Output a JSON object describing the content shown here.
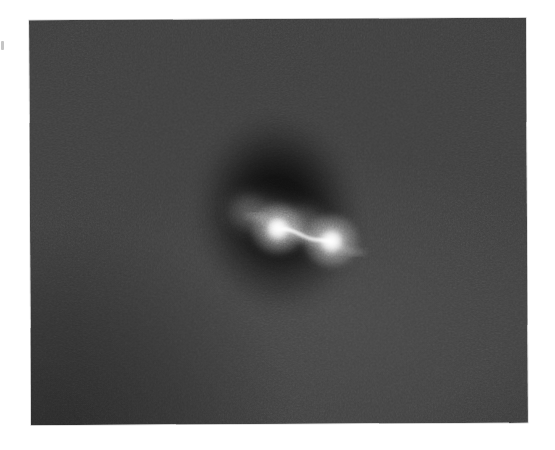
{
  "figure": {
    "kind": "grayscale-astronomical-plate",
    "caption": "",
    "panel": {
      "left": 30,
      "top": 19,
      "width": 497,
      "height": 405,
      "rotation_deg": -0.28,
      "background_color": "#3b3b3b",
      "page_color": "#ffffff"
    },
    "colors": {
      "page": "#ffffff",
      "plate_background": "#3b3b3b",
      "halo_dark": "#141414",
      "core_bright": "#ffffff",
      "bridge": "#e8e8e8"
    },
    "features": [
      {
        "name": "dark-halo",
        "description": "vertically elongated dark elliptical envelope surrounding the pair",
        "cx": 248,
        "cy": 194,
        "rx": 86,
        "ry": 103,
        "rotation_deg": -8
      },
      {
        "name": "core-left",
        "description": "bright compact core, upper left of pair",
        "cx": 248,
        "cy": 210,
        "radius": 11,
        "peak_brightness": 1.0
      },
      {
        "name": "core-right",
        "description": "bright compact core, lower right of pair",
        "cx": 301,
        "cy": 222,
        "radius": 11.5,
        "peak_brightness": 1.0
      },
      {
        "name": "bridge",
        "description": "thin S-curved tidal filament connecting the two cores",
        "from": [
          252,
          212
        ],
        "to": [
          297,
          222
        ]
      },
      {
        "name": "arc-left",
        "description": "tidal arc curving up and to the left of the left core",
        "cx": 214,
        "cy": 186
      },
      {
        "name": "arc-right",
        "description": "tidal arc curving down and to the right of the right core",
        "cx": 282,
        "cy": 212
      },
      {
        "name": "vignette-bottom-left",
        "description": "darker corner vignetting at lower left of plate"
      }
    ]
  },
  "artifacts": {
    "scan_speck": {
      "description": "faint scan speck in the left page margin",
      "left": 1,
      "top": 41
    }
  }
}
